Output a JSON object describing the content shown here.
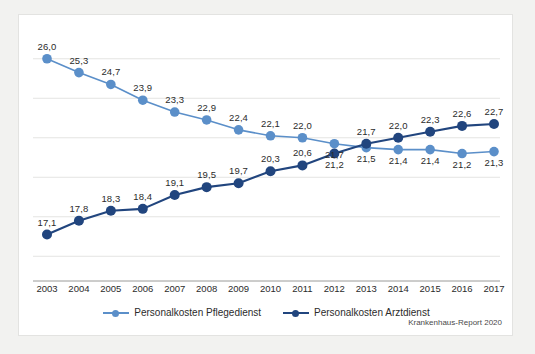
{
  "chart_data": {
    "type": "line",
    "title": "",
    "subtitle": "",
    "xlabel": "",
    "ylabel": "",
    "categories": [
      "2003",
      "2004",
      "2005",
      "2006",
      "2007",
      "2008",
      "2009",
      "2010",
      "2011",
      "2012",
      "2013",
      "2014",
      "2015",
      "2016",
      "2017"
    ],
    "ylim": [
      15.0,
      27.0
    ],
    "grid": true,
    "grid_values": [
      26.0,
      24.0,
      22.0,
      20.0,
      18.0,
      16.0
    ],
    "legend_position": "bottom-center",
    "series": [
      {
        "name": "Personalkosten Pflegedienst",
        "color": "#5b8fc9",
        "label_position": "above",
        "values": [
          26.0,
          25.3,
          24.7,
          23.9,
          23.3,
          22.9,
          22.4,
          22.1,
          22.0,
          21.7,
          21.5,
          21.4,
          21.4,
          21.2,
          21.3
        ],
        "value_labels": [
          "26,0",
          "25,3",
          "24,7",
          "23,9",
          "23,3",
          "22,9",
          "22,4",
          "22,1",
          "22,0",
          "21,7",
          "21,5",
          "21,4",
          "21,4",
          "21,2",
          "21,3"
        ]
      },
      {
        "name": "Personalkosten Arztdienst",
        "color": "#21457e",
        "label_position": "above",
        "values": [
          17.1,
          17.8,
          18.3,
          18.4,
          19.1,
          19.5,
          19.7,
          20.3,
          20.6,
          21.2,
          21.7,
          22.0,
          22.3,
          22.6,
          22.7
        ],
        "value_labels": [
          "17,1",
          "17,8",
          "18,3",
          "18,4",
          "19,1",
          "19,5",
          "19,7",
          "20,3",
          "20,6",
          "21,2",
          "21,7",
          "22,0",
          "22,3",
          "22,6",
          "22,7"
        ]
      }
    ],
    "annotations": []
  },
  "legend": {
    "items": [
      {
        "label": "Personalkosten Pflegedienst",
        "color": "#5b8fc9"
      },
      {
        "label": "Personalkosten Arztdienst",
        "color": "#21457e"
      }
    ]
  },
  "source": {
    "text": "Krankenhaus-Report 2020"
  },
  "colors": {
    "light_series": "#5b8fc9",
    "dark_series": "#21457e",
    "gridline": "#e4e4e2",
    "axis": "#9a9a98",
    "figure_background": "#ffffff",
    "page_background": "#f2f2f0",
    "text": "#2b2b2b"
  }
}
